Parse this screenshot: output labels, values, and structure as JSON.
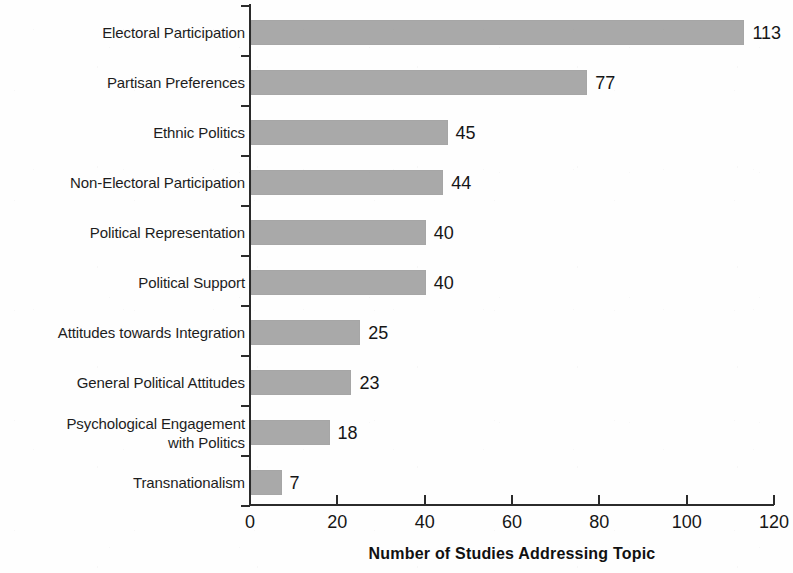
{
  "chart_data": {
    "type": "bar",
    "orientation": "horizontal",
    "title": "",
    "xlabel": "Number of Studies Addressing Topic",
    "ylabel": "",
    "xlim": [
      0,
      120
    ],
    "xticks": [
      0,
      20,
      40,
      60,
      80,
      100,
      120
    ],
    "xtick_labels": [
      "0",
      "20",
      "40",
      "60",
      "80",
      "100",
      "120"
    ],
    "grid": false,
    "legend": null,
    "bar_color": "#a9a9a9",
    "axis_color": "#2b2b2b",
    "categories": [
      "Electoral Participation",
      "Partisan Preferences",
      "Ethnic Politics",
      "Non-Electoral Participation",
      "Political Representation",
      "Political Support",
      "Attitudes towards Integration",
      "General Political Attitudes",
      "Psychological Engagement\nwith Politics",
      "Transnationalism"
    ],
    "values": [
      113,
      77,
      45,
      44,
      40,
      40,
      25,
      23,
      18,
      7
    ],
    "value_labels": [
      "113",
      "77",
      "45",
      "44",
      "40",
      "40",
      "25",
      "23",
      "18",
      "7"
    ]
  }
}
